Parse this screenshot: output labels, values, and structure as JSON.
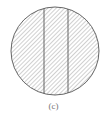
{
  "figure": {
    "caption": "(c)",
    "circle": {
      "cx": 55,
      "cy": 51,
      "r": 44
    },
    "dividers_x": [
      44,
      68
    ],
    "hatch": {
      "angle_deg": 45,
      "spacing_px": 3
    },
    "colors": {
      "stroke": "#555555",
      "hatch": "#8a8a8a",
      "caption": "#777777"
    }
  }
}
